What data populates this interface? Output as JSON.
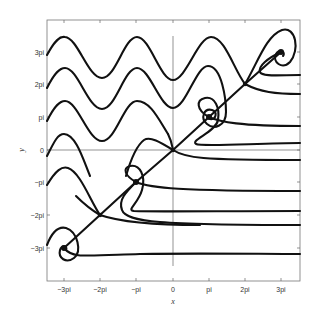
{
  "chart_data": {
    "type": "line",
    "title": "",
    "subtitle": "Phase portrait",
    "xlabel": "x",
    "ylabel": "y",
    "xlim": [
      -3.5,
      3.5
    ],
    "ylim": [
      -4,
      4
    ],
    "x_unit": "pi",
    "y_unit": "pi",
    "x_ticks": [
      "-3pi",
      "-2pi",
      "-pi",
      "0",
      "pi",
      "2pi",
      "3pi"
    ],
    "y_ticks": [
      "-3pi",
      "-2pi",
      "-pi",
      "0",
      "pi",
      "2pi",
      "3pi"
    ],
    "grid": false,
    "legend": null,
    "saddle_points": [
      {
        "x": "-2pi",
        "y": "-2pi"
      },
      {
        "x": "0",
        "y": "0"
      },
      {
        "x": "2pi",
        "y": "2pi"
      }
    ],
    "spiral_sinks": [
      {
        "x": "-3pi",
        "y": "-3pi"
      },
      {
        "x": "-pi",
        "y": "-pi"
      },
      {
        "x": "pi",
        "y": "pi"
      },
      {
        "x": "3pi",
        "y": "3pi"
      }
    ],
    "right_edge_asymptotes_y_pi": [
      2.3,
      1.7,
      0.75,
      0.2,
      -0.3,
      -1.25,
      -1.85,
      -2.3,
      -3.15
    ],
    "series": [
      {
        "name": "wave-1",
        "description": "oscillating trajectory, y approx 3pi, ends at saddle (2pi,2pi) then up"
      },
      {
        "name": "wave-2",
        "description": "oscillating trajectory, y approx 2pi, spirals into (pi,pi)"
      },
      {
        "name": "wave-3",
        "description": "oscillating trajectory, y approx pi"
      },
      {
        "name": "wave-4",
        "description": "trajectory near y=0"
      },
      {
        "name": "separatrix",
        "description": "diagonal through saddles y=x"
      },
      {
        "name": "flat-lines",
        "description": "horizontal trajectories exiting to the right"
      }
    ]
  },
  "labels": {
    "x_axis": "x",
    "y_axis": "y",
    "x_ticks": [
      "−3pi",
      "−2pi",
      "−pi",
      "0",
      "pi",
      "2pi",
      "3pi"
    ],
    "y_ticks": [
      "3pi",
      "2pi",
      "pi",
      "0",
      "−pi",
      "−2pi",
      "−3pi"
    ]
  },
  "paths": [
    "M47,55 C55,40 60,36 65,37 C78,38 88,78 102,78 C116,78 124,37 137,37 C150,37 160,80 173,80 C186,80 198,37 211,37 C225,37 234,70 245,84",
    "M47,88 C55,72 60,68 65,68 C78,68 88,109 102,109 C116,109 124,68 137,68 C150,68 160,108 173,108 C186,108 196,66 208,66 C222,66 226,100 226,112 C226,126 214,130 207,124 C200,118 204,108 212,110 C218,112 216,120 210,119",
    "M47,121 C55,105 60,101 65,101 C78,101 88,141 102,141 C116,141 124,101 137,101 C150,101 158,118 168,134",
    "M47,156 C55,140 58,134 64,134 C76,134 84,162 90,176",
    "M47,185 C56,170 62,166 68,168 C80,172 90,200 100,215",
    "M47,245 C52,232 58,226 66,228 C78,232 82,252 74,258 C66,264 58,258 60,250 C62,244 68,246 66,250",
    "M64,248 L100,215 L136,182 L173,150 L209,117 L245,84 L281,52",
    "M245,84 C258,62 266,36 282,30 C296,26 300,50 290,62 C282,70 272,62 276,54 C280,48 286,52 283,56",
    "M245,84 C260,92 275,94 300,94",
    "M281,52 C268,58 258,66 260,72 C262,77 280,75 300,75",
    "M209,117 C220,122 240,126 300,126",
    "M209,117 C196,110 196,100 205,98 C215,96 220,108 218,120 C216,132 190,140 196,144 C202,147 260,143 300,143",
    "M173,150 C185,158 200,160 300,160",
    "M173,150 C160,142 150,136 144,140 C136,146 130,162 126,176",
    "M136,182 C150,188 180,191 300,191",
    "M136,182 C125,176 122,168 130,166 C140,164 146,176 142,190 C138,204 126,210 134,211 C150,212 220,211 300,211",
    "M136,182 C126,192 118,200 122,210 C126,222 160,225 300,225",
    "M100,215 C120,222 160,225 200,225",
    "M100,215 C88,208 80,200 76,196",
    "M64,248 C72,258 80,256 140,254 C200,253 260,254 300,254",
    "M168,134 C172,142 172,146 173,150"
  ],
  "points": [
    {
      "cx": 100,
      "cy": 215,
      "r": 2.2
    },
    {
      "cx": 173,
      "cy": 150,
      "r": 2.2
    },
    {
      "cx": 245,
      "cy": 84,
      "r": 2.2
    },
    {
      "cx": 64,
      "cy": 248,
      "r": 3
    },
    {
      "cx": 136,
      "cy": 182,
      "r": 3
    },
    {
      "cx": 209,
      "cy": 117,
      "r": 3
    },
    {
      "cx": 281,
      "cy": 52,
      "r": 3
    }
  ]
}
